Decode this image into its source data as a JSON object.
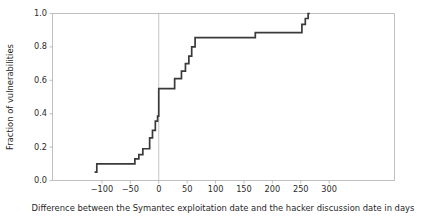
{
  "figure": {
    "width": 439,
    "height": 220,
    "background_color": "#ffffff"
  },
  "chart_data": {
    "type": "line",
    "subtype": "ecdf-step",
    "title": "",
    "subtitle": "",
    "xlabel": "Difference between the Symantec exploitation date and the hacker discussion date in days",
    "ylabel": "Fraction of vulnerabilities",
    "xlim": [
      -187,
      415
    ],
    "ylim": [
      0.0,
      1.0
    ],
    "grid": false,
    "legend": null,
    "line_color": "#3a3a3a",
    "line_width": 1.7,
    "xticks": [
      -100,
      -50,
      0,
      50,
      100,
      150,
      200,
      250,
      300
    ],
    "xticklabels": [
      "-100",
      "-50",
      "0",
      "50",
      "100",
      "150",
      "200",
      "250",
      "300"
    ],
    "yticks": [
      0.0,
      0.2,
      0.4,
      0.6,
      0.8,
      1.0
    ],
    "yticklabels": [
      "0.0",
      "0.2",
      "0.4",
      "0.6",
      "0.8",
      "1.0"
    ],
    "annotations": [
      {
        "name": "zero-reference-line",
        "type": "vline",
        "x": 0,
        "color": "#b8b8b8"
      }
    ],
    "x": [
      -113,
      -113,
      -109,
      -42,
      -35,
      -28,
      -21,
      -16,
      -11,
      -6,
      -2,
      0,
      0,
      28,
      40,
      47,
      53,
      58,
      64,
      72,
      170,
      252,
      258,
      263,
      265
    ],
    "y": [
      0.05,
      0.05,
      0.1,
      0.1,
      0.13,
      0.155,
      0.19,
      0.19,
      0.255,
      0.3,
      0.355,
      0.385,
      0.55,
      0.55,
      0.61,
      0.655,
      0.7,
      0.745,
      0.8,
      0.855,
      0.855,
      0.885,
      0.935,
      0.97,
      1.0
    ],
    "steps": [
      {
        "x": -113,
        "y": 0.05
      },
      {
        "x": -109,
        "y": 0.1
      },
      {
        "x": -42,
        "y": 0.13
      },
      {
        "x": -35,
        "y": 0.155
      },
      {
        "x": -28,
        "y": 0.19
      },
      {
        "x": -16,
        "y": 0.255
      },
      {
        "x": -11,
        "y": 0.3
      },
      {
        "x": -6,
        "y": 0.355
      },
      {
        "x": -2,
        "y": 0.385
      },
      {
        "x": 0,
        "y": 0.55
      },
      {
        "x": 28,
        "y": 0.61
      },
      {
        "x": 40,
        "y": 0.655
      },
      {
        "x": 47,
        "y": 0.7
      },
      {
        "x": 53,
        "y": 0.745
      },
      {
        "x": 58,
        "y": 0.8
      },
      {
        "x": 64,
        "y": 0.855
      },
      {
        "x": 170,
        "y": 0.885
      },
      {
        "x": 252,
        "y": 0.935
      },
      {
        "x": 258,
        "y": 0.97
      },
      {
        "x": 263,
        "y": 1.0
      }
    ]
  }
}
